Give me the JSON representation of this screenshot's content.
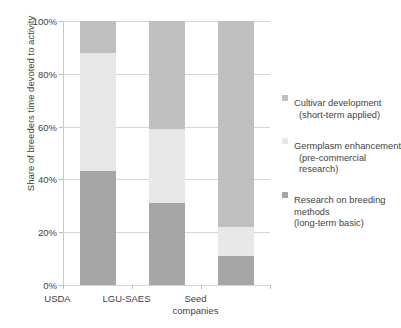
{
  "chart_data": {
    "type": "bar",
    "subtype": "stacked-100-percent",
    "title": "",
    "xlabel": "",
    "ylabel": "Share of breeders time devoted to activity",
    "categories": [
      "USDA",
      "LGU-SAES",
      "Seed companies"
    ],
    "category_lines": [
      [
        "USDA"
      ],
      [
        "LGU-SAES"
      ],
      [
        "Seed",
        "companies"
      ]
    ],
    "ylim": [
      0,
      100
    ],
    "ytick_labels": [
      "0%",
      "20%",
      "40%",
      "60%",
      "80%",
      "100%"
    ],
    "ytick_values": [
      0,
      20,
      40,
      60,
      80,
      100
    ],
    "grid": true,
    "grid_axis": "y",
    "legend_position": "right",
    "stack_order_bottom_to_top": [
      "Research on breeding methods (long-term basic)",
      "Germplasm enhancement (pre-commercial research)",
      "Cultivar development (short-term applied)"
    ],
    "series": [
      {
        "name": "Research on breeding methods (long-term basic)",
        "color": "#a6a6a6",
        "values": [
          43,
          31,
          11
        ]
      },
      {
        "name": "Germplasm enhancement (pre-commercial research)",
        "color": "#e8e8e8",
        "values": [
          45,
          28,
          11
        ]
      },
      {
        "name": "Cultivar development (short-term applied)",
        "color": "#bfbfbf",
        "values": [
          12,
          41,
          78
        ]
      }
    ],
    "legend": [
      {
        "label": "Cultivar development",
        "sublabel": "(short-term applied)",
        "color": "#bfbfbf"
      },
      {
        "label": "Germplasm enhancement",
        "sublabel": "(pre-commercial research)",
        "color": "#e8e8e8"
      },
      {
        "label": "Research on breeding",
        "label_line2": "methods",
        "sublabel": "(long-term basic)",
        "color": "#a6a6a6"
      }
    ]
  },
  "colors": {
    "axis": "#c9c9c9",
    "grid": "#d6d6d6",
    "text": "#3f3f3f",
    "background": "#ffffff"
  }
}
